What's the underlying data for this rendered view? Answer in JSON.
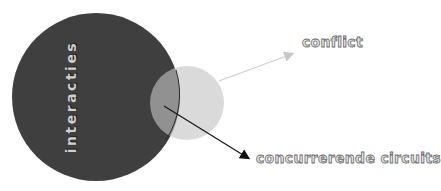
{
  "diagram": {
    "big_circle": {
      "label": "interacties",
      "color": "#3f3f3f"
    },
    "small_circle": {
      "color": "#c8c8c8"
    },
    "arrows": [
      {
        "label": "conflict",
        "color": "#c8c8c8"
      },
      {
        "label": "concurrerende circuits",
        "color": "#1a1a1a"
      }
    ]
  }
}
